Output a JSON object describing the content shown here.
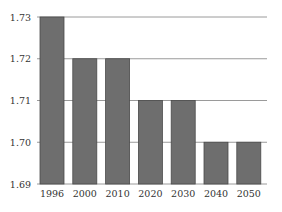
{
  "chart_data": {
    "type": "bar",
    "title": "",
    "xlabel": "",
    "ylabel": "",
    "categories": [
      "1996",
      "2000",
      "2010",
      "2020",
      "2030",
      "2040",
      "2050"
    ],
    "values": [
      1.73,
      1.72,
      1.72,
      1.71,
      1.71,
      1.7,
      1.7
    ],
    "ylim": [
      1.69,
      1.73
    ],
    "yticks": [
      "1.73",
      "1.72",
      "1.71",
      "1.70",
      "1.69"
    ],
    "grid": true,
    "legend": null,
    "colors": {
      "bar": "#6e6e6e",
      "bar_border": "#4a4a4a",
      "grid": "#9a9a9a",
      "text": "#333333"
    }
  }
}
